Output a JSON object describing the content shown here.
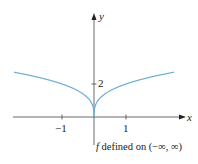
{
  "chart_data": {
    "type": "line",
    "title": "",
    "xlabel": "x",
    "ylabel": "y",
    "x_ticks": [
      "-1",
      "1"
    ],
    "y_ticks": [
      "2"
    ],
    "xlim": [
      -2.5,
      2.5
    ],
    "ylim": [
      0,
      3
    ],
    "grid": false,
    "series": [
      {
        "name": "f",
        "color": "#6aaed6",
        "x": [
          -2.5,
          -2,
          -1.5,
          -1,
          -0.5,
          -0.25,
          -0.1,
          0,
          0.1,
          0.25,
          0.5,
          1,
          1.5,
          2,
          2.5
        ],
        "y": [
          2.71,
          2.52,
          2.29,
          2.0,
          1.59,
          1.26,
          0.93,
          0,
          0.93,
          1.26,
          1.59,
          2.0,
          2.29,
          2.52,
          2.71
        ]
      }
    ],
    "annotation": "f defined on (−∞, ∞)"
  },
  "labels": {
    "y_axis": "y",
    "x_axis": "x",
    "tick_neg1": "−1",
    "tick_1": "1",
    "tick_2": "2",
    "caption_f": "f",
    "caption_rest": " defined on (−∞, ∞)"
  }
}
